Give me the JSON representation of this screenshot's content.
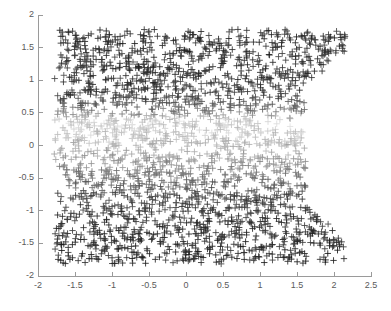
{
  "figure": {
    "background": "#ffffff",
    "axis_color": "#9a9a9a",
    "tick_label_color": "#5a5a5a"
  },
  "chart_data": {
    "type": "scatter",
    "title": "",
    "xlabel": "",
    "ylabel": "",
    "xlim": [
      -2,
      2.5
    ],
    "ylim": [
      -2,
      2
    ],
    "grid": false,
    "legend": null,
    "marker": "+",
    "marker_size": 3.2,
    "x_ticks": [
      -2,
      -1.5,
      -1,
      -0.5,
      0,
      0.5,
      1,
      1.5,
      2,
      2.5
    ],
    "x_tick_labels": [
      "-2",
      "-1.5",
      "-1",
      "-0.5",
      "0",
      "0.5",
      "1",
      "1.5",
      "2",
      "2.5"
    ],
    "y_ticks": [
      -2,
      -1.5,
      -1,
      -0.5,
      0,
      0.5,
      1,
      1.5,
      2
    ],
    "y_tick_labels": [
      "-2",
      "-1.5",
      "-1",
      "-0.5",
      "0",
      "0.5",
      "1",
      "1.5",
      "2"
    ],
    "n_points": 2400,
    "x_domain": [
      -1.78,
      1.62
    ],
    "y_domain": [
      -1.82,
      1.78
    ],
    "corner_taper": {
      "upper_right": {
        "from_x": 1.55,
        "slope": 1.0,
        "max_x": 2.15
      },
      "lower_right": {
        "from_x": 1.55,
        "slope": -1.0,
        "max_x": 2.15
      }
    },
    "shading": {
      "mode": "by-y-value",
      "bands": [
        {
          "y_range": [
            1.0,
            1.8
          ],
          "gray": "#303030"
        },
        {
          "y_range": [
            0.55,
            1.0
          ],
          "gray": "#3a3a3a"
        },
        {
          "y_range": [
            0.5,
            0.55
          ],
          "gray": "#787878"
        },
        {
          "y_range": [
            0.25,
            0.5
          ],
          "gray": "#d2d2d2"
        },
        {
          "y_range": [
            0.0,
            0.25
          ],
          "gray": "#c2c2c2"
        },
        {
          "y_range": [
            -0.3,
            0.0
          ],
          "gray": "#a0a0a0"
        },
        {
          "y_range": [
            -0.6,
            -0.3
          ],
          "gray": "#7a7a7a"
        },
        {
          "y_range": [
            -1.0,
            -0.6
          ],
          "gray": "#404040"
        },
        {
          "y_range": [
            -1.8,
            -1.0
          ],
          "gray": "#2a2a2a"
        }
      ]
    }
  }
}
